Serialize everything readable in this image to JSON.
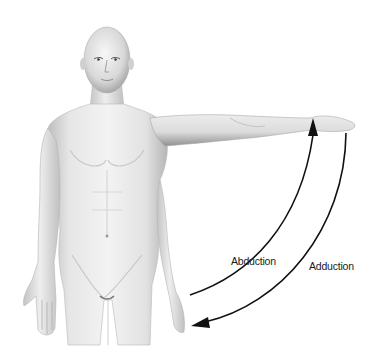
{
  "figure": {
    "labels": {
      "abduction": "Abduction",
      "adduction": "Adduction"
    },
    "arrows": [
      {
        "name": "abduction-arrow",
        "direction": "upward toward raised arm",
        "color": "#111111"
      },
      {
        "name": "adduction-arrow",
        "direction": "downward toward side of body",
        "color": "#111111"
      }
    ],
    "colors": {
      "background": "#ffffff",
      "skin_light": "#f2f2f2",
      "skin_mid": "#d9d9d9",
      "skin_shadow": "#a8a8a8",
      "arrow": "#111111",
      "text": "#1a1a1a"
    }
  }
}
